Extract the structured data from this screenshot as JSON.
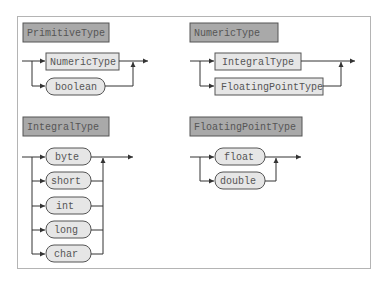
{
  "diagrams": [
    {
      "title": "PrimitiveType",
      "choices": [
        {
          "label": "NumericType",
          "kind": "nonterminal"
        },
        {
          "label": "boolean",
          "kind": "terminal"
        }
      ]
    },
    {
      "title": "NumericType",
      "choices": [
        {
          "label": "IntegralType",
          "kind": "nonterminal"
        },
        {
          "label": "FloatingPointType",
          "kind": "nonterminal"
        }
      ]
    },
    {
      "title": "IntegralType",
      "choices": [
        {
          "label": "byte",
          "kind": "terminal"
        },
        {
          "label": "short",
          "kind": "terminal"
        },
        {
          "label": "int",
          "kind": "terminal"
        },
        {
          "label": "long",
          "kind": "terminal"
        },
        {
          "label": "char",
          "kind": "terminal"
        }
      ]
    },
    {
      "title": "FloatingPointType",
      "choices": [
        {
          "label": "float",
          "kind": "terminal"
        },
        {
          "label": "double",
          "kind": "terminal"
        }
      ]
    }
  ],
  "colors": {
    "title_fill": "#a9a9a9",
    "title_border": "#555555",
    "box_fill": "#e6e6e6",
    "box_border": "#555555",
    "line": "#333333",
    "frame": "#b4b4b4"
  }
}
